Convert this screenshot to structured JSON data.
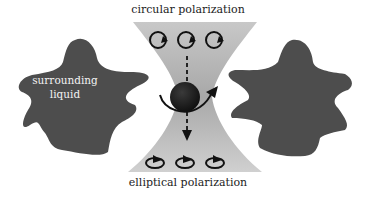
{
  "diagram": {
    "labels": {
      "top": "circular polarization",
      "bottom": "elliptical polarization",
      "liquid_line1": "surrounding",
      "liquid_line2": "liquid"
    },
    "colors": {
      "beam": "#b4b4b4",
      "liquid": "#4d4d4d",
      "particle": "#1a1a1a",
      "arrows": "#111111"
    }
  }
}
